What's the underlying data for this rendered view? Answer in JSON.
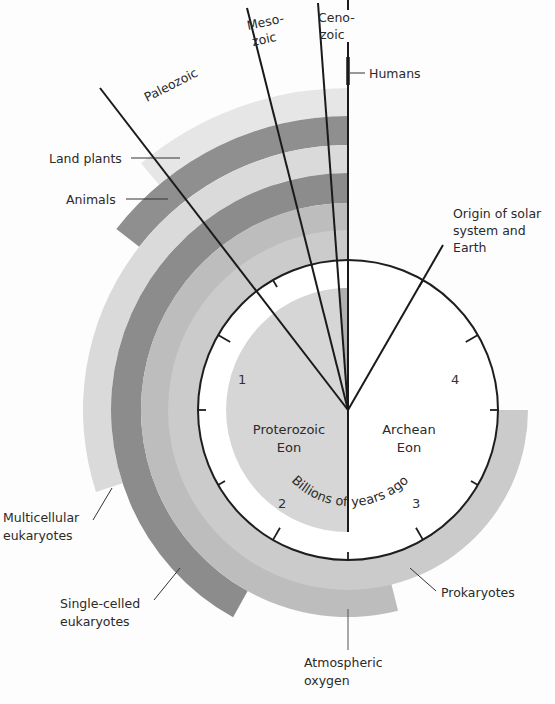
{
  "diagram": {
    "center": {
      "x": 348,
      "y": 410
    },
    "clock_radius": 150,
    "inner_radius": 122,
    "scale_label": "Billions of years ago",
    "scale_numbers": [
      "1",
      "2",
      "3",
      "4"
    ],
    "eons": [
      {
        "name": "Proterozoic",
        "suffix": "Eon"
      },
      {
        "name": "Archean",
        "suffix": "Eon"
      }
    ],
    "eras": [
      {
        "name": "Paleozoic"
      },
      {
        "line1": "Meso-",
        "line2": "zoic"
      },
      {
        "line1": "Ceno-",
        "line2": "zoic"
      }
    ],
    "events": {
      "humans": "Humans",
      "origin": [
        "Origin of solar",
        "system and",
        "Earth"
      ]
    },
    "rings": [
      {
        "label": "Land plants",
        "color": "#e6e6e6",
        "r_outer": 322,
        "r_inner": 294,
        "end_deg": 40
      },
      {
        "label": "Animals",
        "color": "#8f8f8f",
        "r_outer": 294,
        "r_inner": 265,
        "end_deg": 52
      },
      {
        "label": [
          "Multicellular",
          "eukaryotes"
        ],
        "color": "#dadada",
        "r_outer": 265,
        "r_inner": 237,
        "end_deg": 108
      },
      {
        "label": [
          "Single-celled",
          "eukaryotes"
        ],
        "color": "#8c8c8c",
        "r_outer": 237,
        "r_inner": 207,
        "end_deg": 151
      },
      {
        "label": [
          "Atmospheric",
          "oxygen"
        ],
        "color": "#bdbdbd",
        "r_outer": 207,
        "r_inner": 177,
        "end_deg": 194
      },
      {
        "label": "Prokaryotes",
        "color": "#cbcbcb",
        "r_outer": 180,
        "r_inner": 150,
        "end_deg": 270
      }
    ],
    "colors": {
      "background": "#fdfdfd",
      "line": "#1e1e1e",
      "proterozoic_fill": "#d6d6d6",
      "phanerozoic_fill": "#b8b8b8",
      "clock_face": "#ffffff"
    }
  }
}
